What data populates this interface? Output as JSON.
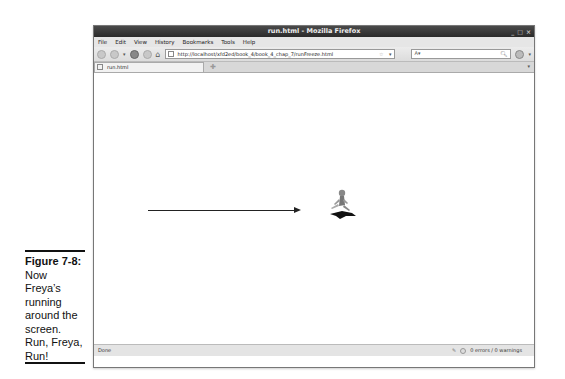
{
  "caption": {
    "figure_label": "Figure 7-8:",
    "text": "Now Freya’s running around the screen. Run, Freya, Run!"
  },
  "window": {
    "title": "run.html - Mozilla Firefox",
    "controls": [
      "_",
      "□",
      "×"
    ]
  },
  "menubar": {
    "items": [
      "File",
      "Edit",
      "View",
      "History",
      "Bookmarks",
      "Tools",
      "Help"
    ]
  },
  "navbar": {
    "url": "http://localhost/xfd2ed/book_4/book_4_chap_7/runFreeze.html",
    "search_value": ""
  },
  "tabs": [
    {
      "label": "run.html"
    }
  ],
  "content": {
    "arrow": "direction-right-arrow",
    "sprite": "running-character-sprite"
  },
  "statusbar": {
    "left": "Done",
    "right": "0 errors / 0 warnings"
  }
}
